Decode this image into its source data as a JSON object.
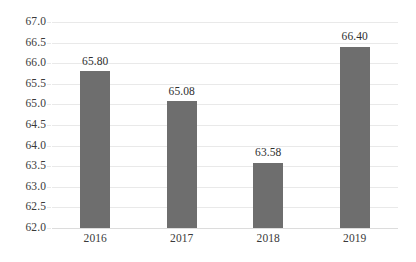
{
  "chart_data": {
    "type": "bar",
    "title": "",
    "subtitle": "",
    "xlabel": "",
    "ylabel": "",
    "categories": [
      "2016",
      "2017",
      "2018",
      "2019"
    ],
    "values": [
      65.8,
      65.08,
      63.58,
      66.4
    ],
    "data_labels": [
      "65.80",
      "65.08",
      "63.58",
      "66.40"
    ],
    "series": [
      {
        "name": "",
        "values": [
          65.8,
          65.08,
          63.58,
          66.4
        ]
      }
    ],
    "ylim": [
      62.0,
      67.0
    ],
    "ytick_step": 0.5,
    "ytick_labels": [
      "67.0",
      "66.5",
      "66.0",
      "65.5",
      "65.0",
      "64.5",
      "64.0",
      "63.5",
      "63.0",
      "62.5",
      "62.0"
    ],
    "ytick_values": [
      67.0,
      66.5,
      66.0,
      65.5,
      65.0,
      64.5,
      64.0,
      63.5,
      63.0,
      62.5,
      62.0
    ],
    "grid": true,
    "grid_axis": "y",
    "legend": false,
    "legend_position": "none",
    "annotations": []
  },
  "style": {
    "background_color": "#ffffff",
    "bar_color": "#6e6e6e",
    "gridline_color": "#e9e9e9",
    "baseline_color": "#dcdcdc",
    "label_color": "#3a3a3a",
    "value_label_color": "#2f2f2f"
  }
}
